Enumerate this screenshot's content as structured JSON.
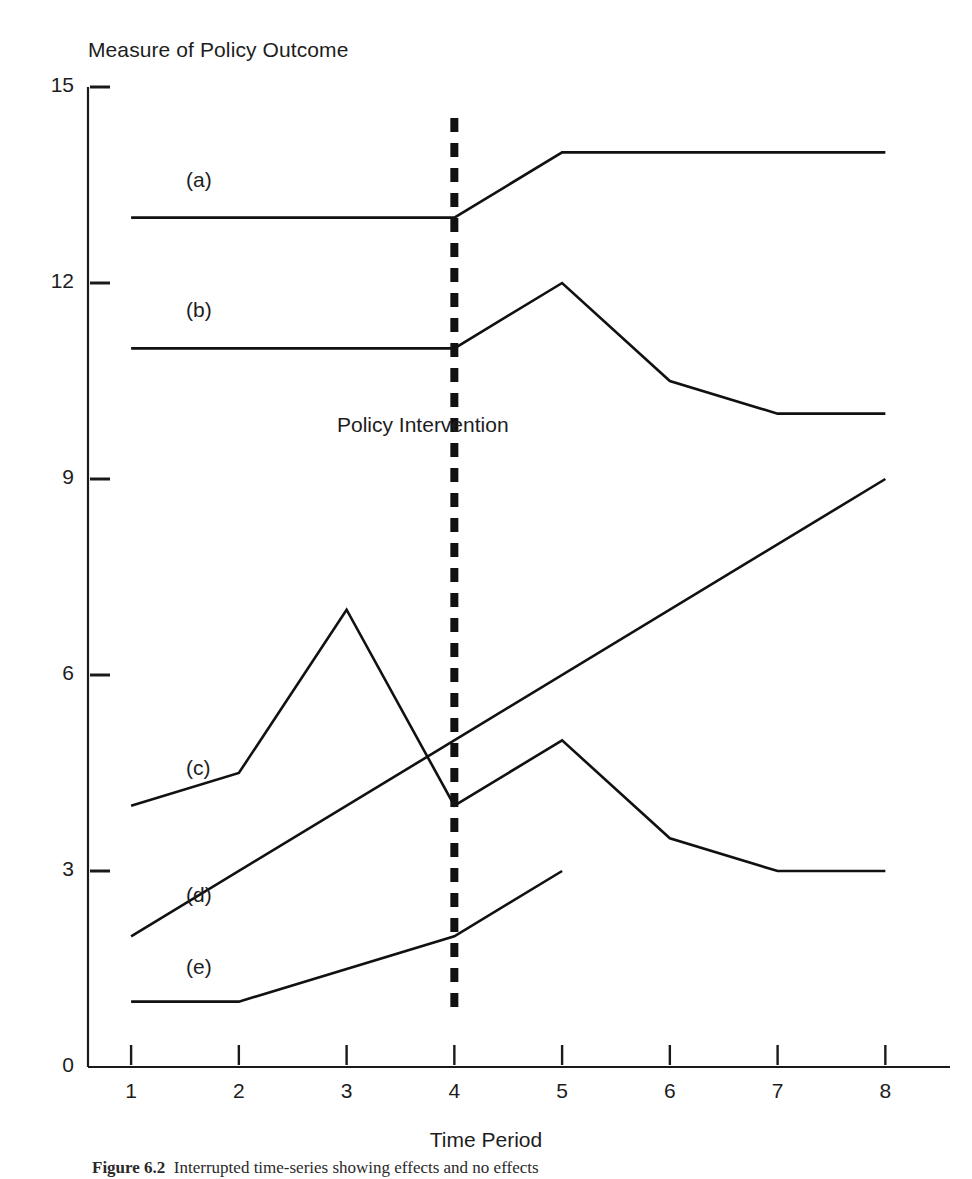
{
  "chart_data": {
    "type": "line",
    "title": "Measure of Policy Outcome",
    "xlabel": "Time Period",
    "ylabel": "Measure of Policy Outcome",
    "x": [
      1,
      2,
      3,
      4,
      5,
      6,
      7,
      8
    ],
    "xlim": [
      0.6,
      8.6
    ],
    "ylim": [
      0,
      15
    ],
    "xticks": [
      "1",
      "2",
      "3",
      "4",
      "5",
      "6",
      "7",
      "8"
    ],
    "yticks": [
      "0",
      "3",
      "6",
      "9",
      "12",
      "15"
    ],
    "ytick_values": [
      0,
      3,
      6,
      9,
      12,
      15
    ],
    "grid": false,
    "legend_position": "inline-left-labels",
    "line_color": "#111111",
    "annotations": [
      {
        "name": "policy-intervention",
        "text": "Policy Intervention",
        "x": 4,
        "style": "vertical dashed line at time period 4"
      }
    ],
    "series": [
      {
        "name": "(a)",
        "label": "(a)",
        "x": [
          1,
          2,
          3,
          4,
          5,
          6,
          7,
          8
        ],
        "values": [
          13,
          13,
          13,
          13,
          14,
          14,
          14,
          14
        ],
        "label_x": 1.25,
        "label_y": 13.55
      },
      {
        "name": "(b)",
        "label": "(b)",
        "x": [
          1,
          2,
          3,
          4,
          5,
          6,
          7,
          8
        ],
        "values": [
          11,
          11,
          11,
          11,
          12,
          10.5,
          10,
          10
        ],
        "label_x": 1.25,
        "label_y": 11.55
      },
      {
        "name": "(c)",
        "label": "(c)",
        "x": [
          1,
          2,
          3,
          4,
          5,
          6,
          7,
          8
        ],
        "values": [
          4,
          4.5,
          7,
          4,
          5,
          3.5,
          3,
          3
        ],
        "label_x": 1.25,
        "label_y": 4.55
      },
      {
        "name": "(d)",
        "label": "(d)",
        "x": [
          1,
          8
        ],
        "values": [
          2,
          9
        ],
        "label_x": 1.25,
        "label_y": 2.6
      },
      {
        "name": "(e)",
        "label": "(e)",
        "x": [
          1,
          2,
          4,
          5
        ],
        "values": [
          1,
          1,
          2,
          3
        ],
        "label_x": 1.25,
        "label_y": 1.5
      }
    ]
  },
  "chart": {
    "title": "Measure of Policy Outcome",
    "xlabel": "Time Period",
    "intervention_label": "Policy Intervention"
  },
  "caption": {
    "figure_number": "Figure 6.2",
    "text": "Interrupted time-series showing effects and no effects"
  }
}
